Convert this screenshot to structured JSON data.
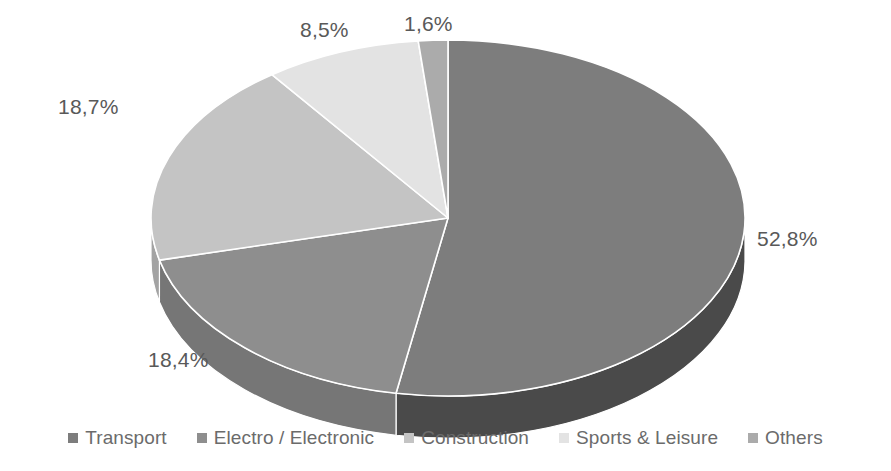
{
  "chart_data": {
    "type": "pie",
    "title": "",
    "subtitle": "",
    "xlabel": "",
    "ylabel": "",
    "grid": false,
    "three_d": true,
    "legend_position": "bottom",
    "decimal_separator": ",",
    "categories": [
      "Transport",
      "Electro / Electronic",
      "Construction",
      "Sports & Leisure",
      "Others"
    ],
    "values": [
      52.8,
      18.4,
      18.7,
      8.5,
      1.6
    ],
    "value_labels": [
      "52,8%",
      "18,4%",
      "18,7%",
      "8,5%",
      "1,6%"
    ],
    "colors": [
      "#7d7d7d",
      "#8e8e8e",
      "#c4c4c4",
      "#e3e3e3",
      "#ababab"
    ],
    "side_colors": [
      "#4a4a4a",
      "#767676",
      "#a3a3a3",
      "#bdbdbd",
      "#8c8c8c"
    ],
    "slices": [
      {
        "name": "Transport",
        "value": 52.8,
        "label": "52,8%",
        "color": "#7d7d7d",
        "side": "#4a4a4a"
      },
      {
        "name": "Electro / Electronic",
        "value": 18.4,
        "label": "18,4%",
        "color": "#8e8e8e",
        "side": "#767676"
      },
      {
        "name": "Construction",
        "value": 18.7,
        "label": "18,7%",
        "color": "#c4c4c4",
        "side": "#a3a3a3"
      },
      {
        "name": "Sports & Leisure",
        "value": 8.5,
        "label": "8,5%",
        "color": "#e3e3e3",
        "side": "#bdbdbd"
      },
      {
        "name": "Others",
        "value": 1.6,
        "label": "1,6%",
        "color": "#ababab",
        "side": "#8c8c8c"
      }
    ]
  },
  "labels": {
    "transport": "52,8%",
    "electro": "18,4%",
    "construction": "18,7%",
    "sports": "8,5%",
    "others": "1,6%"
  },
  "legend": {
    "items": [
      {
        "label": "Transport",
        "color": "#7d7d7d"
      },
      {
        "label": "Electro / Electronic",
        "color": "#8e8e8e"
      },
      {
        "label": "Construction",
        "color": "#c4c4c4"
      },
      {
        "label": "Sports & Leisure",
        "color": "#e3e3e3"
      },
      {
        "label": "Others",
        "color": "#ababab"
      }
    ]
  },
  "colors": {
    "label_text": "#595959",
    "legend_text": "#6b6b6b",
    "background": "#ffffff",
    "slice_outline": "#ffffff"
  }
}
